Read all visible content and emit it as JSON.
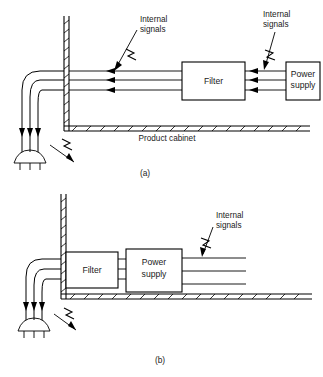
{
  "figure": {
    "background_color": "#ffffff",
    "line_color": "#000000",
    "text_color": "#1a1a1a"
  },
  "panel_a": {
    "caption": "(a)",
    "cabinet_label": "Product cabinet",
    "filter_label": "Filter",
    "power_supply_label_line1": "Power",
    "power_supply_label_line2": "supply",
    "internal_signals_left_line1": "Internal",
    "internal_signals_left_line2": "signals",
    "internal_signals_right_line1": "Internal",
    "internal_signals_right_line2": "signals",
    "conductor_count": 3,
    "arrow_direction": "left",
    "description": "Filter placed away from the cabinet wall; internal signals couple onto the mains conductors inside the cabinet and escape on the power cord."
  },
  "panel_b": {
    "caption": "(b)",
    "filter_label": "Filter",
    "power_supply_label_line1": "Power",
    "power_supply_label_line2": "supply",
    "internal_signals_line1": "Internal",
    "internal_signals_line2": "signals",
    "conductor_count": 3,
    "description": "Filter mounted at the cabinet wall bulkhead directly ahead of the power supply; internal signals leave to the right and do not couple to the mains cord."
  },
  "icons": {
    "mains_plug": "mains-plug-icon",
    "noise_burst": "lightning-bolt-icon",
    "coupling_arrow": "arrow-icon"
  }
}
